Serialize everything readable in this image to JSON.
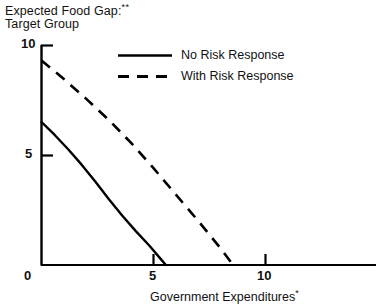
{
  "chart_data": {
    "type": "line",
    "title": "Expected Food Gap:** Target Group",
    "title_line1": "Expected Food Gap:",
    "title_line1_sup": "**",
    "title_line2": "Target Group",
    "xlabel": "Government Expenditures",
    "xlabel_sup": "*",
    "ylabel": "",
    "xlim": [
      0,
      15
    ],
    "ylim": [
      0,
      10
    ],
    "xticks": [
      0,
      5,
      10
    ],
    "xtick_labels": [
      "0",
      "5",
      "10"
    ],
    "yticks": [
      0,
      5,
      10
    ],
    "ytick_labels": [
      "0",
      "5",
      "10"
    ],
    "grid": false,
    "legend_position": "top-center",
    "series": [
      {
        "name": "No Risk Response",
        "style": "solid",
        "color": "#000000",
        "x": [
          0.0,
          0.6,
          1.2,
          1.8,
          2.4,
          3.0,
          3.6,
          4.2,
          4.8,
          5.3,
          5.55
        ],
        "y": [
          6.5,
          5.9,
          5.25,
          4.55,
          3.8,
          3.0,
          2.25,
          1.55,
          0.9,
          0.3,
          0.0
        ]
      },
      {
        "name": "With Risk Response",
        "style": "dashed",
        "color": "#000000",
        "x": [
          0.0,
          1.0,
          2.0,
          3.0,
          4.0,
          5.0,
          6.0,
          7.0,
          8.0,
          8.55
        ],
        "y": [
          9.3,
          8.45,
          7.55,
          6.6,
          5.55,
          4.4,
          3.2,
          2.0,
          0.75,
          0.0
        ]
      }
    ],
    "legend": [
      {
        "label": "No Risk Response",
        "style": "solid"
      },
      {
        "label": "With Risk Response",
        "style": "dashed"
      }
    ],
    "axis_color": "#000000"
  }
}
